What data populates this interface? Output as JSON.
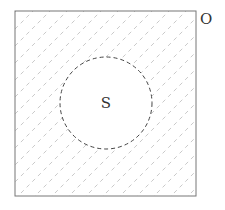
{
  "diagram": {
    "type": "venn",
    "universe": {
      "label": "O",
      "x": 15,
      "y": 11,
      "width": 181,
      "height": 185
    },
    "set": {
      "label": "S",
      "cx": 106,
      "cy": 103,
      "r": 46,
      "border": "dashed"
    },
    "shading": {
      "region": "O minus S",
      "pattern": "diagonal dashed hatching",
      "color": "#bbbbbb"
    },
    "colors": {
      "frame": "#777777",
      "circle": "#444444",
      "text": "#333333"
    }
  }
}
